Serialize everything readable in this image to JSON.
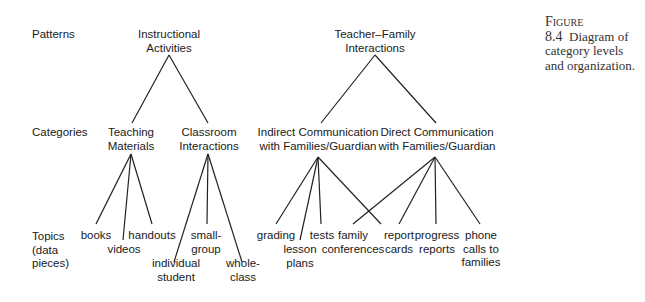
{
  "caption": {
    "figure": "Figure 8.4",
    "text": "Diagram of category levels and organization."
  },
  "levels": {
    "patterns": "Patterns",
    "categories": "Categories",
    "topics_1": "Topics",
    "topics_2": "(data",
    "topics_3": "pieces)"
  },
  "patterns": [
    {
      "line1": "Instructional",
      "line2": "Activities"
    },
    {
      "line1": "Teacher–Family",
      "line2": "Interactions"
    }
  ],
  "categories": [
    {
      "line1": "Teaching",
      "line2": "Materials"
    },
    {
      "line1": "Classroom",
      "line2": "Interactions"
    },
    {
      "line1": "Indirect Communication",
      "line2": "with Families/Guardian"
    },
    {
      "line1": "Direct Communication",
      "line2": "with Families/Guardian"
    }
  ],
  "topics": [
    {
      "line1": "books"
    },
    {
      "line1": "videos"
    },
    {
      "line1": "handouts"
    },
    {
      "line1": "individual",
      "line2": "student"
    },
    {
      "line1": "small-",
      "line2": "group"
    },
    {
      "line1": "whole-",
      "line2": "class"
    },
    {
      "line1": "grading"
    },
    {
      "line1": "lesson",
      "line2": "plans"
    },
    {
      "line1": "tests"
    },
    {
      "line1": "family",
      "line2": "conferences"
    },
    {
      "line1": "report",
      "line2": "cards"
    },
    {
      "line1": "progress",
      "line2": "reports"
    },
    {
      "line1": "phone",
      "line2": "calls to",
      "line3": "families"
    }
  ]
}
